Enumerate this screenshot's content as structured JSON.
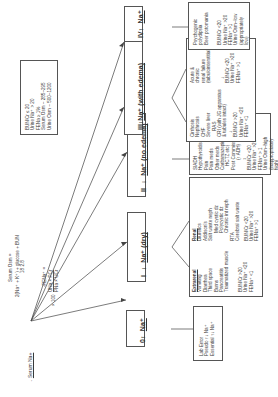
{
  "title": "Serum Na+",
  "formulas": {
    "osm_label": "Serum Osm =",
    "osm_expr": "2(Na+ + K+) + glucose/18 + BUN/2.8",
    "osm_line1": "2(Na⁺ + K⁺) + glucose + BUN",
    "osm_line2": "18        2.8",
    "fena_label": "-FENa⁺ =",
    "fena_num": "UNa × PCr",
    "fena_den": "PNa × UCr",
    "fena_mult": "× 100"
  },
  "root_criteria": [
    "BUN/Cr ≤ 20",
    "Urine Na⁺ > 20",
    "FENa ≥ 1%",
    "Serum Osm ~ 285–295",
    "Urine Osm ~ 500–1200"
  ],
  "categories": [
    {
      "id": "0",
      "label": "0",
      "arrow": "↕",
      "na": "Na⁺",
      "details": [
        "Lab Error",
        "Pseudo ↑↓ Na⁺",
        "Essential ↑↓ Na⁺"
      ]
    },
    {
      "id": "I",
      "label": "I",
      "arrow": "↓",
      "na": "Na⁺ (dry)",
      "extrarenal_title": "Extrarenal",
      "extrarenal": [
        "Vomiting",
        "Diarrhea",
        "Third space",
        "Burns",
        "Pancreatitis",
        "Traumatized muscle"
      ],
      "extrarenal_labs": [
        "BUN/Cr >20",
        "Urine Na⁺ <20",
        "FENa⁺ <1"
      ],
      "renal_title": "Renal",
      "renal": [
        "Diuretics",
        "Addison's",
        "Salt waste neph",
        "Med cystic dz",
        "Polycystic dz",
        "Chronic int neph",
        "RTA",
        "Cerebral salt waste"
      ],
      "renal_labs": [
        "BUN/Cr <20",
        "Urine Na⁺ >20",
        "FENa⁺ >1"
      ]
    },
    {
      "id": "II",
      "label": "II",
      "arrow": "↓",
      "na": "Na⁺ (no edema)",
      "details": [
        "SIADH",
        "Hypothyroidism",
        "Pain",
        "Pain meds",
        "Other meds",
        "Carbamazepine,",
        "HCTZ etc)",
        "Post Commissurotomy",
        "(↑ ADH)"
      ],
      "labs": [
        "BUN/Cr <20",
        "Urine Na⁺ >20",
        "FENa⁺ > 1",
        "Urine Osm–high",
        "(inappropriately",
        "high)"
      ]
    },
    {
      "id": "III",
      "label": "III",
      "arrow": "↓",
      "na": "Na⁺ (with edema)",
      "left": [
        "Cirrhosis",
        "Nephrosis",
        "CHF",
        "Severe liver",
        "RAS",
        "CRI (with JG apparatus",
        "& tubules intact)"
      ],
      "left_labs": [
        "BUN/Cr >20",
        "Urine Na⁺ <20",
        "FENa⁺ <1"
      ],
      "right": [
        "Acute &",
        "chronic",
        "renal failure",
        "(tubulointerstitial)"
      ],
      "right_labs": [
        "BUN/Cr <20",
        "Urine Na⁺ >20",
        "FENa⁺ >1"
      ]
    },
    {
      "id": "IV",
      "label": "IV",
      "arrow": "↑",
      "na": "Na⁺",
      "details": [
        "Psychogenic",
        "polydipsia",
        "Beer potomania"
      ],
      "labs": [
        "BUN/Cr <20",
        "Urine Na⁺ >20",
        "FENa⁺ >1",
        "Urine Osm–low",
        "(appropriately",
        "low)"
      ]
    }
  ]
}
